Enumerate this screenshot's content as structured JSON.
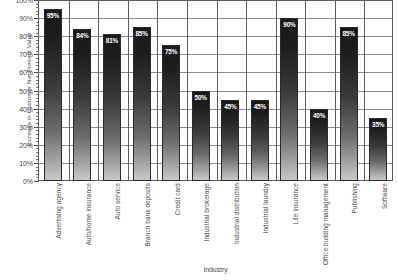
{
  "chart_data": {
    "type": "bar",
    "title": "",
    "xlabel": "Industry",
    "ylabel": "Increase in Customer Net Present Value",
    "ylim": [
      0,
      100
    ],
    "ytick_labels": [
      "100%",
      "90%",
      "80%",
      "70%",
      "60%",
      "50%",
      "40%",
      "30%",
      "20%",
      "10%",
      "0%"
    ],
    "ytick_values": [
      100,
      90,
      80,
      70,
      60,
      50,
      40,
      30,
      20,
      10,
      0
    ],
    "grid": "horizontal-and-vertical",
    "legend": "none",
    "value_label_suffix": "%",
    "categories": [
      "Advertising agency",
      "Auto/home insurance",
      "Auto service",
      "Branch bank deposits",
      "Credit card",
      "Industrial brokerage",
      "Industrial distribution",
      "Industrial laundry",
      "Life insurance",
      "Office building management",
      "Publishing",
      "Software"
    ],
    "values": [
      95,
      84,
      81,
      85,
      75,
      50,
      45,
      45,
      90,
      40,
      85,
      35
    ],
    "value_labels": [
      "95%",
      "84%",
      "81%",
      "85%",
      "75%",
      "50%",
      "45%",
      "45%",
      "90%",
      "40%",
      "85%",
      "35%"
    ],
    "colors": {
      "bar_top": "#18181a",
      "bar_bottom": "#c9c9cb",
      "grid": "#8d8d8d",
      "frame": "#5c5c5c",
      "text": "#4a4a4a",
      "value_label": "#ffffff",
      "background": "#ffffff"
    }
  }
}
